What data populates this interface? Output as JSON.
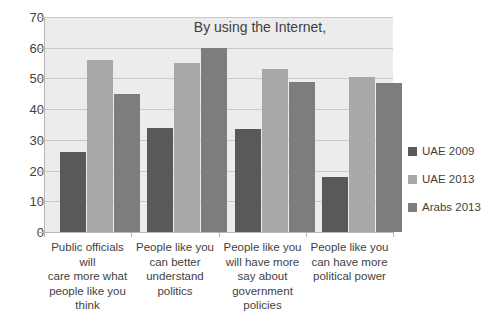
{
  "chart_data": {
    "type": "bar",
    "title": "By using the Internet,",
    "xlabel": "",
    "ylabel": "",
    "ylim": [
      0,
      70
    ],
    "yticks": [
      0,
      10,
      20,
      30,
      40,
      50,
      60,
      70
    ],
    "grid": true,
    "legend_position": "right",
    "categories": [
      "Public officials will care more what people like you think",
      "People like you can better understand politics",
      "People like you will have more say about government policies",
      "People like you can have more political power"
    ],
    "category_lines": [
      [
        "Public officials will",
        "care more what",
        "people like you",
        "think"
      ],
      [
        "People like you",
        "can better",
        "understand",
        "politics"
      ],
      [
        "People like you",
        "will have more",
        "say about",
        "government",
        "policies"
      ],
      [
        "People like you",
        "can have more",
        "political power"
      ]
    ],
    "series": [
      {
        "name": "UAE 2009",
        "color": "#595959",
        "values": [
          26,
          34,
          33.5,
          18
        ]
      },
      {
        "name": "UAE 2013",
        "color": "#a8a8a8",
        "values": [
          56,
          55,
          53,
          50.5
        ]
      },
      {
        "name": "Arabs 2013",
        "color": "#7d7d7d",
        "values": [
          45,
          60,
          49,
          48.5
        ]
      }
    ]
  }
}
